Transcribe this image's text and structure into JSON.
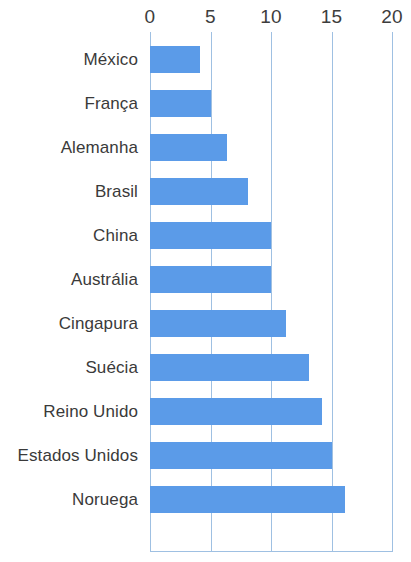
{
  "chart_data": {
    "type": "bar",
    "orientation": "horizontal",
    "title": "",
    "subtitle": "",
    "xlabel": "",
    "ylabel": "",
    "xlim": [
      0,
      20
    ],
    "ticks": [
      "0",
      "5",
      "10",
      "15",
      "20"
    ],
    "tick_values": [
      0,
      5,
      10,
      15,
      20
    ],
    "grid": true,
    "legend": null,
    "legend_position": "none",
    "categories": [
      "México",
      "França",
      "Alemanha",
      "Brasil",
      "China",
      "Austrália",
      "Cingapura",
      "Suécia",
      "Reino Unido",
      "Estados Unidos",
      "Noruega"
    ],
    "values": [
      4.1,
      5.0,
      6.4,
      8.1,
      10.0,
      10.0,
      11.2,
      13.1,
      14.2,
      15.0,
      16.1
    ],
    "bar_color": "#5b9be8",
    "gridline_color": "#9fc0e2",
    "label_color": "#3a3a3a",
    "background_color": "#ffffff"
  }
}
